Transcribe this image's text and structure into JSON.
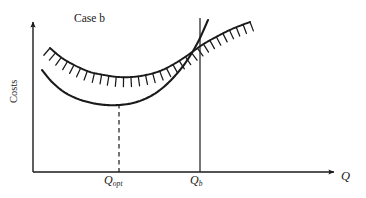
{
  "figure": {
    "case_label": "Case b",
    "y_axis_label": "Costs",
    "x_axis_label": "Q",
    "q_opt": {
      "base": "Q",
      "subscript": "opt"
    },
    "q_b": {
      "base": "Q",
      "subscript": "b"
    },
    "line_color": "#1a1a1a",
    "background_color": "#ffffff"
  },
  "chart_data": {
    "type": "line",
    "title": "Case b",
    "xlabel": "Q",
    "ylabel": "Costs",
    "grid": false,
    "legend": null,
    "axis_arrows": {
      "x": true,
      "y": true
    },
    "annotations": [
      {
        "name": "q-opt-tick",
        "label": "Q opt",
        "x_px": 119,
        "style": "dashed-vertical-to-curve-minimum"
      },
      {
        "name": "q-b-line",
        "label": "Q b",
        "x_px": 200,
        "style": "solid-vertical-full-height"
      }
    ],
    "series": [
      {
        "name": "cost-curve",
        "style": "solid",
        "description": "U-shaped average cost curve, minimum at Q_opt",
        "points_px": [
          [
            42,
            70
          ],
          [
            52,
            82
          ],
          [
            64,
            92
          ],
          [
            78,
            99
          ],
          [
            92,
            103
          ],
          [
            106,
            105
          ],
          [
            119,
            105
          ],
          [
            133,
            103
          ],
          [
            147,
            98
          ],
          [
            160,
            90
          ],
          [
            173,
            78
          ],
          [
            186,
            62
          ],
          [
            198,
            42
          ],
          [
            208,
            20
          ]
        ]
      },
      {
        "name": "hatched-constraint-curve",
        "style": "hatched",
        "hatch_side": "outer",
        "hatch_count": 30,
        "description": "Hatched boundary curve lying above the cost curve, rising to the upper right",
        "points_px": [
          [
            50,
            48
          ],
          [
            62,
            58
          ],
          [
            76,
            66
          ],
          [
            90,
            72
          ],
          [
            104,
            75
          ],
          [
            118,
            77
          ],
          [
            132,
            77
          ],
          [
            146,
            75
          ],
          [
            160,
            71
          ],
          [
            174,
            64
          ],
          [
            188,
            55
          ],
          [
            202,
            45
          ],
          [
            216,
            37
          ],
          [
            232,
            29
          ],
          [
            250,
            22
          ]
        ]
      }
    ],
    "axes_px": {
      "origin": [
        33,
        172
      ],
      "x_end": [
        338,
        172
      ],
      "y_end": [
        33,
        18
      ]
    }
  }
}
